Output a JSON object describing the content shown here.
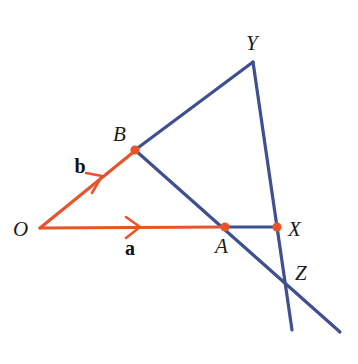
{
  "figure": {
    "background_color": "#ffffff",
    "colors": {
      "vector_orange": "#E8542A",
      "line_blue": "#3E4F92",
      "label_black": "#1b1b1b"
    },
    "stroke_widths": {
      "vector": 3.2,
      "line": 3.2,
      "arrowhead": 2.4
    },
    "points": [
      {
        "id": "O",
        "label": "O",
        "x": 40,
        "y": 228,
        "label_x": 22,
        "label_y": 236,
        "dot": false,
        "dot_color": "#E8542A"
      },
      {
        "id": "B",
        "label": "B",
        "x": 135,
        "y": 150,
        "label_x": 120,
        "label_y": 141,
        "dot": true,
        "dot_color": "#E8542A"
      },
      {
        "id": "A",
        "label": "A",
        "x": 225,
        "y": 227,
        "label_x": 222,
        "label_y": 252,
        "dot": true,
        "dot_color": "#E8542A"
      },
      {
        "id": "X",
        "label": "X",
        "x": 277,
        "y": 227,
        "label_x": 292,
        "label_y": 236,
        "dot": true,
        "dot_color": "#E8542A"
      },
      {
        "id": "Y",
        "label": "Y",
        "x": 253,
        "y": 62,
        "label_x": 250,
        "label_y": 50,
        "dot": false,
        "dot_color": "#3E4F92"
      },
      {
        "id": "Z",
        "label": "Z",
        "x": 288,
        "y": 282,
        "label_x": 298,
        "label_y": 279,
        "dot": false,
        "dot_color": "#3E4F92"
      }
    ],
    "vectors": [
      {
        "id": "a",
        "label": "a",
        "from": "O",
        "to": "A",
        "x1": 40,
        "y1": 228,
        "x2": 225,
        "y2": 227,
        "color": "#E8542A",
        "arrow_x": 136,
        "arrow_y": 227,
        "arrow_angle": 0,
        "label_x": 130,
        "label_y": 254
      },
      {
        "id": "b",
        "label": "b",
        "from": "O",
        "to": "B",
        "x1": 40,
        "y1": 228,
        "x2": 135,
        "y2": 150,
        "color": "#E8542A",
        "arrow_x": 98,
        "arrow_y": 180,
        "arrow_angle": -39.4,
        "label_x": 76,
        "label_y": 173
      }
    ],
    "segments": [
      {
        "id": "B-Y",
        "from": "B",
        "to": "Y",
        "x1": 135,
        "y1": 150,
        "x2": 253,
        "y2": 62,
        "color": "#3E4F92"
      },
      {
        "id": "B-A-Z",
        "from": "B",
        "to": "Z-extension",
        "x1": 135,
        "y1": 150,
        "x2": 340,
        "y2": 332,
        "color": "#3E4F92"
      },
      {
        "id": "A-X",
        "from": "A",
        "to": "X",
        "x1": 225,
        "y1": 227,
        "x2": 277,
        "y2": 227,
        "color": "#3E4F92"
      },
      {
        "id": "Y-X-Z",
        "from": "Y",
        "to": "Z-extension",
        "x1": 253,
        "y1": 62,
        "x2": 292,
        "y2": 330,
        "color": "#3E4F92"
      }
    ],
    "labels": {
      "O": "O",
      "A": "A",
      "B": "B",
      "X": "X",
      "Y": "Y",
      "Z": "Z",
      "vector_a": "a",
      "vector_b": "b"
    }
  }
}
